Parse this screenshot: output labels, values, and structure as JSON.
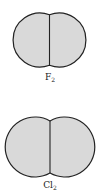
{
  "molecules": [
    {
      "symbol": "F",
      "subscript": "2",
      "fill": "#d8d8d8",
      "stroke": "#222222"
    },
    {
      "symbol": "Cl",
      "subscript": "2",
      "fill": "#d8d8d8",
      "stroke": "#222222"
    }
  ]
}
